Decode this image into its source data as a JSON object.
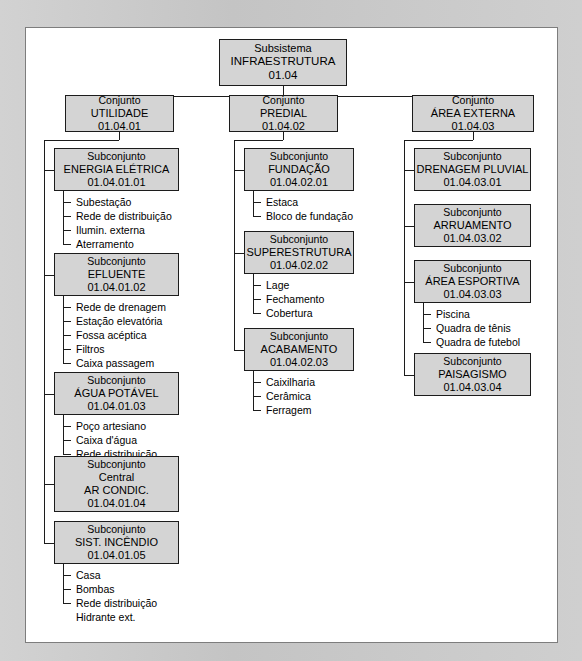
{
  "diagram": {
    "colors": {
      "box_fill": "#d4d4d4",
      "box_border": "#1c1c1c",
      "panel_bg": "#ffffff",
      "frame_bg": "#c9c9c9",
      "line": "#1c1c1c",
      "text": "#000000"
    },
    "root": {
      "level_label": "Subsistema",
      "name": "INFRAESTRUTURA",
      "code": "01.04"
    },
    "conjuntos": [
      {
        "level_label": "Conjunto",
        "name": "UTILIDADE",
        "code": "01.04.01",
        "subconjuntos": [
          {
            "level_label": "Subconjunto",
            "name": "ENERGIA ELÉTRICA",
            "code": "01.04.01.01",
            "items": [
              "Subestação",
              "Rede de distribuição",
              "Ilumin. externa",
              "Aterramento"
            ]
          },
          {
            "level_label": "Subconjunto",
            "name": "EFLUENTE",
            "code": "01.04.01.02",
            "items": [
              "Rede de drenagem",
              "Estação elevatória",
              "Fossa acéptica",
              "Filtros",
              "Caixa passagem"
            ]
          },
          {
            "level_label": "Subconjunto",
            "name": "ÁGUA POTÁVEL",
            "code": "01.04.01.03",
            "items": [
              "Poço artesiano",
              "Caixa d'água",
              "Rede distribuição"
            ]
          },
          {
            "level_label": "Subconjunto",
            "name": "Central",
            "name2": "AR CONDIC.",
            "code": "01.04.01.04",
            "items": []
          },
          {
            "level_label": "Subconjunto",
            "name": "SIST. INCÊNDIO",
            "code": "01.04.01.05",
            "items": [
              "Casa",
              "Bombas",
              "Rede distribuição",
              "Hidrante ext."
            ]
          }
        ]
      },
      {
        "level_label": "Conjunto",
        "name": "PREDIAL",
        "code": "01.04.02",
        "subconjuntos": [
          {
            "level_label": "Subconjunto",
            "name": "FUNDAÇÃO",
            "code": "01.04.02.01",
            "items": [
              "Estaca",
              "Bloco de fundação"
            ]
          },
          {
            "level_label": "Subconjunto",
            "name": "SUPERESTRUTURA",
            "code": "01.04.02.02",
            "items": [
              "Lage",
              "Fechamento",
              "Cobertura"
            ]
          },
          {
            "level_label": "Subconjunto",
            "name": "ACABAMENTO",
            "code": "01.04.02.03",
            "items": [
              "Caixilharia",
              "Cerâmica",
              "Ferragem"
            ]
          }
        ]
      },
      {
        "level_label": "Conjunto",
        "name": "ÁREA EXTERNA",
        "code": "01.04.03",
        "subconjuntos": [
          {
            "level_label": "Subconjunto",
            "name": "DRENAGEM PLUVIAL",
            "code": "01.04.03.01",
            "items": []
          },
          {
            "level_label": "Subconjunto",
            "name": "ARRUAMENTO",
            "code": "01.04.03.02",
            "items": []
          },
          {
            "level_label": "Subconjunto",
            "name": "ÁREA ESPORTIVA",
            "code": "01.04.03.03",
            "items": [
              "Piscina",
              "Quadra de tênis",
              "Quadra de futebol"
            ]
          },
          {
            "level_label": "Subconjunto",
            "name": "PAISAGISMO",
            "code": "01.04.03.04",
            "items": []
          }
        ]
      }
    ]
  }
}
